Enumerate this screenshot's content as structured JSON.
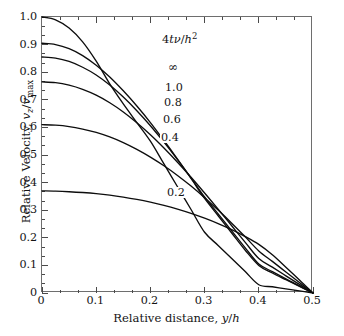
{
  "chart_data": {
    "type": "line",
    "title": "",
    "xlabel": "Relative distance, y/h",
    "ylabel": "Relative Velocity, v_z/v_max",
    "parameter_title": "4tv/h2",
    "parameter_title_plain": "4tν/h²",
    "xlim": [
      0,
      0.5
    ],
    "ylim": [
      0,
      1.0
    ],
    "xticks": [
      "0",
      "0.1",
      "0.2",
      "0.3",
      "0.4",
      "0.5"
    ],
    "xtick_values": [
      0,
      0.1,
      0.2,
      0.3,
      0.4,
      0.5
    ],
    "yticks": [
      "0",
      "0.1",
      "0.2",
      "0.3",
      "0.4",
      "0.5",
      "0.6",
      "0.7",
      "0.8",
      "0.9",
      "1.0"
    ],
    "ytick_values": [
      0,
      0.1,
      0.2,
      0.3,
      0.4,
      0.5,
      0.6,
      0.7,
      0.8,
      0.9,
      1.0
    ],
    "minor_ticks_per_interval": 2,
    "grid": false,
    "legend": "inline-curve-labels",
    "line_color": "#0d0d0d",
    "frame_color": "#6e6e6e",
    "background": "#ffffff",
    "x": [
      0,
      0.025,
      0.05,
      0.075,
      0.1,
      0.125,
      0.15,
      0.175,
      0.2,
      0.225,
      0.25,
      0.275,
      0.3,
      0.325,
      0.35,
      0.375,
      0.4,
      0.425,
      0.45,
      0.475,
      0.5
    ],
    "series": [
      {
        "name": "inf",
        "label": "∞",
        "values": [
          1.0,
          0.99,
          0.96,
          0.91,
          0.84,
          0.7575,
          0.685,
          0.6175,
          0.55,
          0.4675,
          0.385,
          0.3025,
          0.22,
          0.1725,
          0.125,
          0.0775,
          0.03,
          0.0225,
          0.015,
          0.0075,
          0.0
        ]
      },
      {
        "name": "1.0",
        "label": "1.0",
        "values": [
          0.905,
          0.9,
          0.885,
          0.86,
          0.825,
          0.7825,
          0.7325,
          0.6775,
          0.6175,
          0.5525,
          0.485,
          0.415,
          0.3425,
          0.28,
          0.2175,
          0.155,
          0.1,
          0.0725,
          0.048,
          0.024,
          0.0
        ]
      },
      {
        "name": "0.8",
        "label": "0.8",
        "values": [
          0.855,
          0.851,
          0.839,
          0.818,
          0.79,
          0.7535,
          0.71,
          0.6605,
          0.606,
          0.5465,
          0.483,
          0.4165,
          0.348,
          0.2865,
          0.225,
          0.1635,
          0.105,
          0.0775,
          0.051,
          0.0255,
          0.0
        ]
      },
      {
        "name": "0.6",
        "label": "0.6",
        "values": [
          0.765,
          0.762,
          0.753,
          0.738,
          0.717,
          0.6895,
          0.656,
          0.617,
          0.5735,
          0.5255,
          0.474,
          0.4195,
          0.3625,
          0.3035,
          0.2435,
          0.1835,
          0.125,
          0.0935,
          0.0622,
          0.031,
          0.0
        ]
      },
      {
        "name": "0.4",
        "label": "0.4",
        "values": [
          0.61,
          0.608,
          0.603,
          0.594,
          0.582,
          0.5655,
          0.545,
          0.5205,
          0.4925,
          0.461,
          0.426,
          0.3875,
          0.3455,
          0.3005,
          0.253,
          0.2035,
          0.1525,
          0.1145,
          0.0762,
          0.038,
          0.0
        ]
      },
      {
        "name": "0.2",
        "label": "0.2",
        "values": [
          0.37,
          0.369,
          0.367,
          0.364,
          0.36,
          0.3545,
          0.3475,
          0.339,
          0.329,
          0.3175,
          0.304,
          0.2885,
          0.271,
          0.2515,
          0.2295,
          0.2045,
          0.176,
          0.1385,
          0.0935,
          0.0475,
          0.0
        ]
      }
    ],
    "curve_labels": [
      {
        "text": "∞",
        "x_px": 167,
        "y_px": 65
      },
      {
        "text": "1.0",
        "x_px": 164,
        "y_px": 87
      },
      {
        "text": "0.8",
        "x_px": 163,
        "y_px": 102
      },
      {
        "text": "0.6",
        "x_px": 162,
        "y_px": 119
      },
      {
        "text": "0.4",
        "x_px": 160,
        "y_px": 137
      },
      {
        "text": "0.2",
        "x_px": 166,
        "y_px": 192
      }
    ]
  }
}
